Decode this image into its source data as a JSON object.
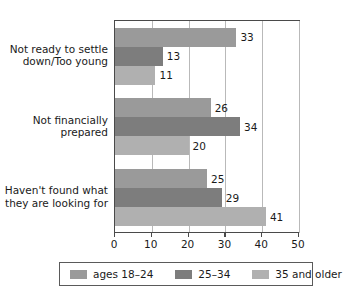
{
  "chart_data": {
    "type": "bar",
    "orientation": "horizontal",
    "title": "",
    "xlabel": "",
    "ylabel": "",
    "xlim": [
      0,
      50
    ],
    "xticks": [
      0,
      10,
      20,
      30,
      40,
      50
    ],
    "xtick_labels": [
      "0",
      "10",
      "20",
      "30",
      "40",
      "50"
    ],
    "grid": true,
    "legend_position": "bottom",
    "categories": [
      "Not ready to settle down/Too young",
      "Not financially prepared",
      "Haven't found what they are looking for"
    ],
    "category_lines": [
      [
        "Not ready to settle",
        "down/Too young"
      ],
      [
        "Not financially",
        "prepared"
      ],
      [
        "Haven't found what",
        "they are looking for"
      ]
    ],
    "series": [
      {
        "name": "ages 18–24",
        "color": "#9a9a9a",
        "values": [
          33,
          26,
          25
        ]
      },
      {
        "name": "25–34",
        "color": "#7d7d7d",
        "values": [
          13,
          34,
          29
        ]
      },
      {
        "name": "35 and older",
        "color": "#b0b0b0",
        "values": [
          11,
          20,
          41
        ]
      }
    ],
    "data_labels": [
      [
        "33",
        "13",
        "11"
      ],
      [
        "26",
        "34",
        "20"
      ],
      [
        "25",
        "29",
        "41"
      ]
    ]
  },
  "legend": {
    "items": [
      {
        "label": "ages 18–24",
        "color": "#9a9a9a"
      },
      {
        "label": "25–34",
        "color": "#7d7d7d"
      },
      {
        "label": "35 and older",
        "color": "#b0b0b0"
      }
    ]
  }
}
